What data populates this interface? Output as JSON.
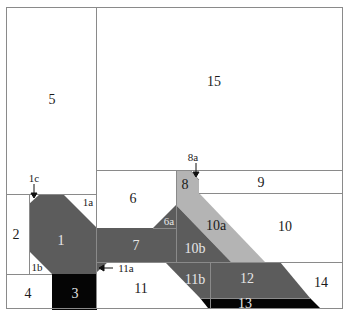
{
  "colors": {
    "background": "#ffffff",
    "line": "#8a8a8a",
    "dark_gray": "#5c5c5c",
    "light_gray": "#b4b4b4",
    "black": "#050505",
    "label_dark": "#1a1a1a",
    "label_light": "#e6e6e6"
  },
  "regions": [
    {
      "id": "1",
      "label": "1",
      "fill": "dark_gray"
    },
    {
      "id": "1a",
      "label": "1a",
      "fill": "none"
    },
    {
      "id": "1b",
      "label": "1b",
      "fill": "none"
    },
    {
      "id": "1c",
      "label": "1c",
      "fill": "none",
      "annotation": "arrow"
    },
    {
      "id": "2",
      "label": "2",
      "fill": "none"
    },
    {
      "id": "3",
      "label": "3",
      "fill": "black"
    },
    {
      "id": "4",
      "label": "4",
      "fill": "none"
    },
    {
      "id": "5",
      "label": "5",
      "fill": "none"
    },
    {
      "id": "6",
      "label": "6",
      "fill": "none"
    },
    {
      "id": "6a",
      "label": "6a",
      "fill": "dark_gray"
    },
    {
      "id": "7",
      "label": "7",
      "fill": "dark_gray"
    },
    {
      "id": "8",
      "label": "8",
      "fill": "light_gray"
    },
    {
      "id": "8a",
      "label": "8a",
      "fill": "none",
      "annotation": "arrow"
    },
    {
      "id": "9",
      "label": "9",
      "fill": "none"
    },
    {
      "id": "10",
      "label": "10",
      "fill": "none"
    },
    {
      "id": "10a",
      "label": "10a",
      "fill": "light_gray"
    },
    {
      "id": "10b",
      "label": "10b",
      "fill": "dark_gray"
    },
    {
      "id": "11",
      "label": "11",
      "fill": "none"
    },
    {
      "id": "11a",
      "label": "11a",
      "fill": "dark_gray",
      "annotation": "arrow"
    },
    {
      "id": "11b",
      "label": "11b",
      "fill": "dark_gray"
    },
    {
      "id": "12",
      "label": "12",
      "fill": "dark_gray"
    },
    {
      "id": "13",
      "label": "13",
      "fill": "black"
    },
    {
      "id": "14",
      "label": "14",
      "fill": "none"
    },
    {
      "id": "15",
      "label": "15",
      "fill": "none"
    }
  ],
  "labels": {
    "r1": "1",
    "r1a": "1a",
    "r1b": "1b",
    "r1c": "1c",
    "r2": "2",
    "r3": "3",
    "r4": "4",
    "r5": "5",
    "r6": "6",
    "r6a": "6a",
    "r7": "7",
    "r8": "8",
    "r8a": "8a",
    "r9": "9",
    "r10": "10",
    "r10a": "10a",
    "r10b": "10b",
    "r11": "11",
    "r11a": "11a",
    "r11b": "11b",
    "r12": "12",
    "r13": "13",
    "r14": "14",
    "r15": "15"
  }
}
